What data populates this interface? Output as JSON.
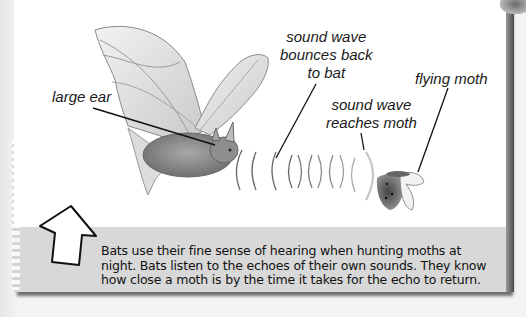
{
  "diagram": {
    "topic": "Bat echolocation",
    "labels": {
      "large_ear": "large ear",
      "bounce_back": [
        "sound wave",
        "bounces back",
        "to bat"
      ],
      "reaches_moth": [
        "sound wave",
        "reaches moth"
      ],
      "flying_moth": "flying moth"
    },
    "caption_lines": [
      "Bats use their fine sense of hearing when hunting moths at",
      "night. Bats listen to the echoes of their own sounds. They know",
      "how close a moth is by the time it takes for the echo to return."
    ],
    "icons": {
      "pointer": "up-arrow-icon",
      "bat": "bat-illustration",
      "moth": "moth-illustration",
      "waves": "sound-wave-arcs"
    },
    "colors": {
      "card": "#d8d8d8",
      "panel": "#ffffff",
      "ink": "#1a1a1a"
    }
  }
}
